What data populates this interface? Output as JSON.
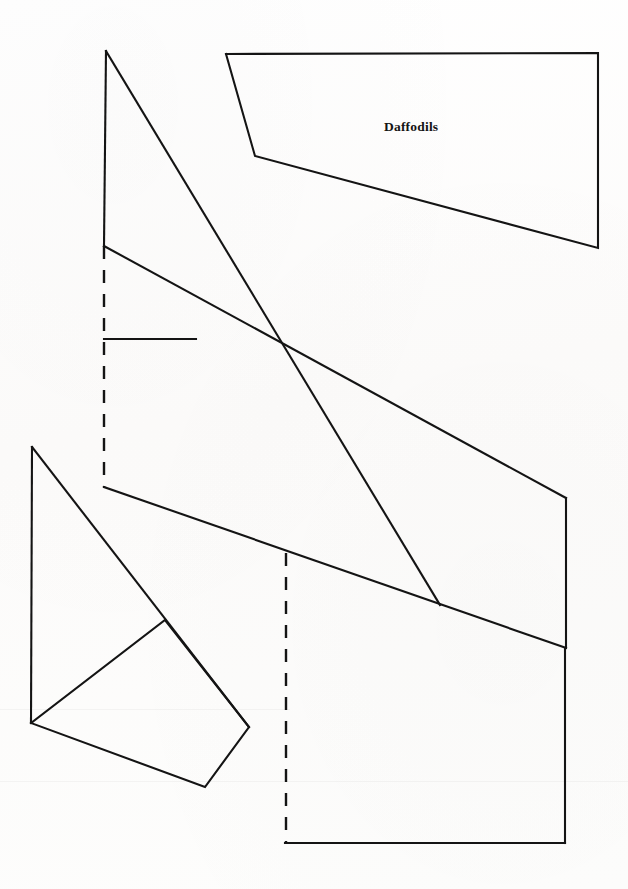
{
  "document": {
    "title": "Daffodils Pattern Template",
    "background_color": "#fdfdfc",
    "ink_color": "#141414",
    "width": 628,
    "height": 889
  },
  "labels": [
    {
      "name": "daffodils-label",
      "text": "Daffodils",
      "x": 384,
      "y": 119
    }
  ],
  "diagram": {
    "type": "pattern-template",
    "solid_paths": [
      {
        "name": "top-left-vertical-edge",
        "points": "106,51 104,246"
      },
      {
        "name": "long-main-diagonal",
        "points": "106,51 440,605"
      },
      {
        "name": "upper-right-panel-outline",
        "points": "226,54 598,53 598,248 255,156 226,54"
      },
      {
        "name": "upper-inner-diagonal",
        "points": "104,246 566,498"
      },
      {
        "name": "short-horizontal-tick",
        "points": "104,339 196,339"
      },
      {
        "name": "mid-slope-edge",
        "points": "104,487 566,648"
      },
      {
        "name": "right-vertical-edge-upper",
        "points": "566,498 566,648"
      },
      {
        "name": "right-vertical-edge-lower",
        "points": "565,648 565,843"
      },
      {
        "name": "bottom-horizontal-edge",
        "points": "285,843 565,843"
      },
      {
        "name": "lower-left-vertical-edge",
        "points": "32,447 31,723"
      },
      {
        "name": "lower-left-long-diagonal",
        "points": "32,447 249,727"
      },
      {
        "name": "lower-left-quad-outline",
        "points": "31,723 165,620 249,727 205,787 31,723"
      }
    ],
    "dashed_paths": [
      {
        "name": "upper-fold-line",
        "points": "104,246 104,487"
      },
      {
        "name": "lower-fold-line",
        "points": "286,553 286,843"
      }
    ]
  }
}
